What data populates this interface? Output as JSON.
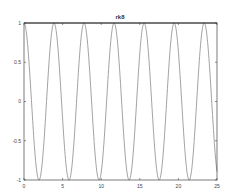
{
  "chart_data": {
    "type": "line",
    "title": "rk8",
    "xlabel": "",
    "ylabel": "",
    "xlim": [
      0,
      25
    ],
    "ylim": [
      -1,
      1
    ],
    "xticks": [
      0,
      5,
      10,
      15,
      20,
      25
    ],
    "xtick_labels": [
      "0",
      "5",
      "10",
      "15",
      "20",
      "25"
    ],
    "yticks": [
      -1,
      -0.5,
      0,
      0.5,
      1
    ],
    "ytick_labels": [
      "-1",
      "-0.5",
      "0",
      "0.5",
      "1"
    ],
    "grid": false,
    "legend": null,
    "series": [
      {
        "name": "solution",
        "function": "cos(1.615 * t)",
        "omega": 1.615,
        "color": "#8a8a8a",
        "x": [
          0,
          0.97,
          1.95,
          2.92,
          3.89,
          4.86,
          5.84,
          6.81,
          7.78,
          8.76,
          9.73,
          10.7,
          11.67,
          12.65,
          13.62,
          14.59,
          15.56,
          16.54,
          17.51,
          18.48,
          19.46,
          20.43,
          21.4,
          22.38,
          23.35,
          24.32,
          25
        ],
        "y": [
          1,
          0,
          -1,
          0,
          1,
          0,
          -1,
          0,
          1,
          0,
          -1,
          0,
          1,
          0,
          -1,
          0,
          1,
          0,
          -1,
          0,
          1,
          0,
          -1,
          0,
          1,
          0,
          -0.9
        ]
      }
    ]
  },
  "colors": {
    "axes": "#333333",
    "line": "#8a8a8a",
    "text": "#444444",
    "background": "#ffffff"
  }
}
